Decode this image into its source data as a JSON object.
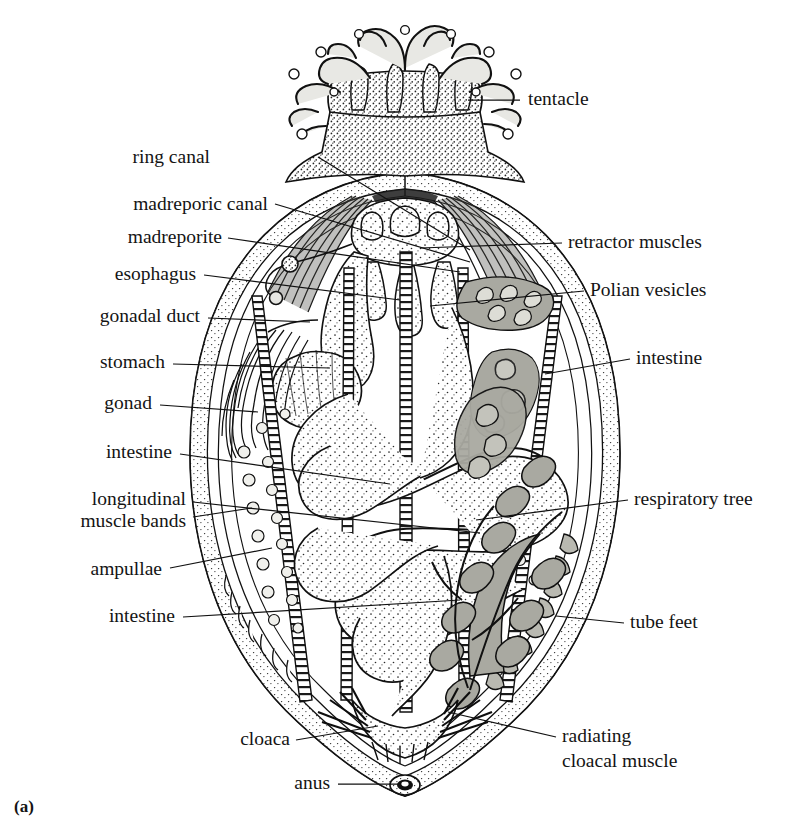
{
  "figure": {
    "caption": "(a)",
    "colors": {
      "ink": "#111111",
      "tissue_gray": "#a9a9a1",
      "tissue_light_gray": "#c3c3bb",
      "background": "#ffffff"
    }
  },
  "labels_left": [
    {
      "id": "ring-canal",
      "text": "ring canal",
      "x": 210,
      "y": 163,
      "anchor": "end",
      "leader": [
        [
          318,
          157
        ],
        [
          470,
          250
        ]
      ]
    },
    {
      "id": "madreporic-canal",
      "text": "madreporic canal",
      "x": 268,
      "y": 210,
      "anchor": "end",
      "leader": [
        [
          275,
          204
        ],
        [
          470,
          262
        ]
      ]
    },
    {
      "id": "madreporite",
      "text": "madreporite",
      "x": 222,
      "y": 243,
      "anchor": "end",
      "leader": [
        [
          228,
          238
        ],
        [
          460,
          272
        ]
      ]
    },
    {
      "id": "esophagus",
      "text": "esophagus",
      "x": 196,
      "y": 280,
      "anchor": "end",
      "leader": [
        [
          204,
          275
        ],
        [
          400,
          300
        ]
      ]
    },
    {
      "id": "gonadal-duct",
      "text": "gonadal duct",
      "x": 200,
      "y": 322,
      "anchor": "end",
      "leader": [
        [
          208,
          318
        ],
        [
          310,
          322
        ]
      ]
    },
    {
      "id": "stomach",
      "text": "stomach",
      "x": 165,
      "y": 368,
      "anchor": "end",
      "leader": [
        [
          173,
          364
        ],
        [
          330,
          368
        ]
      ]
    },
    {
      "id": "gonad",
      "text": "gonad",
      "x": 152,
      "y": 409,
      "anchor": "end",
      "leader": [
        [
          160,
          405
        ],
        [
          258,
          412
        ]
      ]
    },
    {
      "id": "intestine-upper-left",
      "text": "intestine",
      "x": 172,
      "y": 458,
      "anchor": "end",
      "leader": [
        [
          180,
          454
        ],
        [
          390,
          484
        ]
      ]
    },
    {
      "id": "longitudinal-muscle-bands-1",
      "text": "longitudinal",
      "x": 186,
      "y": 505,
      "anchor": "end",
      "leader": [
        [
          193,
          502
        ],
        [
          480,
          533
        ]
      ]
    },
    {
      "id": "longitudinal-muscle-bands-2",
      "text": "muscle bands",
      "x": 186,
      "y": 527,
      "anchor": "end",
      "leader": [
        [
          193,
          517
        ],
        [
          252,
          508
        ]
      ]
    },
    {
      "id": "ampullae",
      "text": "ampullae",
      "x": 162,
      "y": 575,
      "anchor": "end",
      "leader": [
        [
          170,
          568
        ],
        [
          272,
          548
        ]
      ]
    },
    {
      "id": "intestine-lower-left",
      "text": "intestine",
      "x": 175,
      "y": 622,
      "anchor": "end",
      "leader": [
        [
          183,
          617
        ],
        [
          460,
          600
        ]
      ]
    },
    {
      "id": "cloaca",
      "text": "cloaca",
      "x": 290,
      "y": 745,
      "anchor": "end",
      "leader": [
        [
          296,
          740
        ],
        [
          378,
          726
        ]
      ]
    },
    {
      "id": "anus",
      "text": "anus",
      "x": 330,
      "y": 789,
      "anchor": "end",
      "leader": [
        [
          338,
          784
        ],
        [
          398,
          784
        ]
      ]
    }
  ],
  "labels_right": [
    {
      "id": "tentacle",
      "text": "tentacle",
      "x": 528,
      "y": 105,
      "anchor": "start",
      "leader": [
        [
          520,
          100
        ],
        [
          468,
          100
        ]
      ]
    },
    {
      "id": "retractor-muscles",
      "text": "retractor muscles",
      "x": 568,
      "y": 248,
      "anchor": "start",
      "leader": [
        [
          562,
          243
        ],
        [
          420,
          248
        ]
      ]
    },
    {
      "id": "polian-vesicles",
      "text": "Polian vesicles",
      "x": 590,
      "y": 296,
      "anchor": "start",
      "leader": [
        [
          584,
          291
        ],
        [
          430,
          306
        ]
      ]
    },
    {
      "id": "intestine-right",
      "text": "intestine",
      "x": 636,
      "y": 364,
      "anchor": "start",
      "leader": [
        [
          630,
          359
        ],
        [
          545,
          374
        ]
      ]
    },
    {
      "id": "respiratory-tree",
      "text": "respiratory tree",
      "x": 634,
      "y": 505,
      "anchor": "start",
      "leader": [
        [
          628,
          500
        ],
        [
          476,
          520
        ]
      ]
    },
    {
      "id": "tube-feet",
      "text": "tube feet",
      "x": 630,
      "y": 628,
      "anchor": "start",
      "leader": [
        [
          624,
          623
        ],
        [
          556,
          616
        ]
      ]
    },
    {
      "id": "radiating-cloacal-muscle-1",
      "text": "radiating",
      "x": 562,
      "y": 742,
      "anchor": "start",
      "leader": [
        [
          556,
          737
        ],
        [
          448,
          712
        ]
      ]
    },
    {
      "id": "radiating-cloacal-muscle-2",
      "text": "cloacal muscle",
      "x": 562,
      "y": 767,
      "anchor": "start",
      "leader": null
    }
  ],
  "anatomy_parts": [
    "tentacle",
    "ring canal",
    "madreporic canal",
    "madreporite",
    "esophagus",
    "gonadal duct",
    "stomach",
    "gonad",
    "intestine",
    "longitudinal muscle bands",
    "ampullae",
    "cloaca",
    "anus",
    "retractor muscles",
    "Polian vesicles",
    "respiratory tree",
    "tube feet",
    "radiating cloacal muscle"
  ]
}
